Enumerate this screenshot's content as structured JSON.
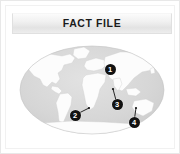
{
  "card": {
    "header": {
      "title": "FACT FILE"
    },
    "caption": {
      "left": "",
      "center": "",
      "right": ""
    }
  },
  "map": {
    "alt_name": "world-map",
    "projection": "oval world map",
    "ocean_color": "#d7d7d7",
    "land_color": "#fbfbfb",
    "marker_color": "#121212",
    "marker_label_color": "#ffffff",
    "markers": [
      {
        "label": "1",
        "x": 98,
        "y": 30,
        "leader": null
      },
      {
        "label": "2",
        "x": 63,
        "y": 76,
        "leader": {
          "x": 77,
          "y": 69
        }
      },
      {
        "label": "3",
        "x": 105,
        "y": 65,
        "leader": {
          "x": 101,
          "y": 50
        }
      },
      {
        "label": "4",
        "x": 122,
        "y": 83,
        "leader": {
          "x": 124,
          "y": 69
        }
      }
    ]
  }
}
